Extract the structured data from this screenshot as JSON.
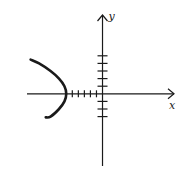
{
  "chart_data": {
    "type": "line",
    "title": "",
    "xlabel": "x",
    "ylabel": "y",
    "x_ticks": [
      -5,
      -4,
      -3,
      -2,
      -1
    ],
    "y_ticks": [
      -3,
      -2,
      -1,
      1,
      2,
      3,
      4,
      5
    ],
    "tick_labels_shown": false,
    "xlim": [
      -12.5,
      12
    ],
    "ylim": [
      -9.5,
      10.5
    ],
    "grid": false,
    "legend": null,
    "series": [
      {
        "name": "parabola",
        "equation": "x = -6 - 0.29*y^2",
        "vertex": [
          -6,
          0
        ],
        "points": [
          {
            "x": -11.9,
            "y": 4.5
          },
          {
            "x": -10.5,
            "y": 4
          },
          {
            "x": -8.6,
            "y": 3
          },
          {
            "x": -7.2,
            "y": 2
          },
          {
            "x": -6.3,
            "y": 1
          },
          {
            "x": -6,
            "y": 0
          },
          {
            "x": -6.3,
            "y": -1
          },
          {
            "x": -7.2,
            "y": -2
          },
          {
            "x": -8.6,
            "y": -3
          },
          {
            "x": -9.4,
            "y": -3.1
          }
        ],
        "color": "#1a1a1a"
      }
    ]
  },
  "colors": {
    "ink": "#1a1a1a",
    "background": "#ffffff"
  }
}
